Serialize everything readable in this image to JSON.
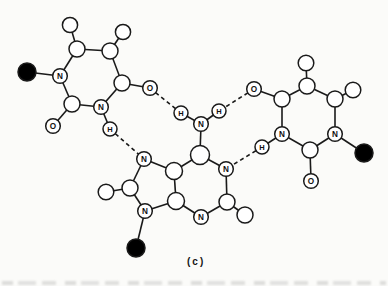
{
  "caption": "(c)",
  "palette": {
    "background": "#fbfbf9",
    "line": "#1a1a1a",
    "atom_fill": "#ffffff",
    "filled_atom": "#000000",
    "label_color": "#111111"
  },
  "molecule": {
    "description": "hydrogen-bonded base triplet: central purine flanked by two pyrimidines",
    "atoms": [
      {
        "id": "L_sugar",
        "x": 27,
        "y": 72,
        "r": 9,
        "type": "filled"
      },
      {
        "id": "L_N1",
        "x": 60,
        "y": 76,
        "r": 7.3,
        "type": "labeled",
        "label": "N"
      },
      {
        "id": "L_C6",
        "x": 77,
        "y": 49,
        "r": 8,
        "type": "open"
      },
      {
        "id": "L_H6",
        "x": 70,
        "y": 25,
        "r": 7.6,
        "type": "open"
      },
      {
        "id": "L_C5",
        "x": 110,
        "y": 51,
        "r": 8,
        "type": "open"
      },
      {
        "id": "L_H5",
        "x": 123,
        "y": 32,
        "r": 7.6,
        "type": "open"
      },
      {
        "id": "L_C4",
        "x": 122,
        "y": 83,
        "r": 8,
        "type": "open"
      },
      {
        "id": "L_O4",
        "x": 150,
        "y": 88,
        "r": 7.3,
        "type": "labeled",
        "label": "O"
      },
      {
        "id": "L_N3",
        "x": 101,
        "y": 107,
        "r": 7.3,
        "type": "labeled",
        "label": "N"
      },
      {
        "id": "L_H3",
        "x": 110,
        "y": 129,
        "r": 7,
        "type": "labeled",
        "label": "H"
      },
      {
        "id": "L_C2",
        "x": 72,
        "y": 104,
        "r": 8,
        "type": "open"
      },
      {
        "id": "L_O2",
        "x": 53,
        "y": 126,
        "r": 7.3,
        "type": "labeled",
        "label": "O"
      },
      {
        "id": "R_O4",
        "x": 254,
        "y": 89,
        "r": 7.3,
        "type": "labeled",
        "label": "O"
      },
      {
        "id": "R_C4",
        "x": 282,
        "y": 99,
        "r": 8,
        "type": "open"
      },
      {
        "id": "R_C5",
        "x": 307,
        "y": 86,
        "r": 8,
        "type": "open"
      },
      {
        "id": "R_H5",
        "x": 306,
        "y": 63,
        "r": 7.8,
        "type": "open"
      },
      {
        "id": "R_C6",
        "x": 335,
        "y": 99,
        "r": 8,
        "type": "open"
      },
      {
        "id": "R_H6",
        "x": 353,
        "y": 90,
        "r": 7.8,
        "type": "open"
      },
      {
        "id": "R_N1",
        "x": 335,
        "y": 134,
        "r": 7.3,
        "type": "labeled",
        "label": "N"
      },
      {
        "id": "R_sugar",
        "x": 364,
        "y": 153,
        "r": 9,
        "type": "filled"
      },
      {
        "id": "R_C2",
        "x": 310,
        "y": 150,
        "r": 8,
        "type": "open"
      },
      {
        "id": "R_O2",
        "x": 311,
        "y": 181,
        "r": 7.3,
        "type": "labeled",
        "label": "O"
      },
      {
        "id": "R_N3",
        "x": 282,
        "y": 134,
        "r": 7.3,
        "type": "labeled",
        "label": "N"
      },
      {
        "id": "R_H3",
        "x": 262,
        "y": 147,
        "r": 7,
        "type": "labeled",
        "label": "H"
      },
      {
        "id": "P_C6",
        "x": 200,
        "y": 155,
        "r": 9.5,
        "type": "open"
      },
      {
        "id": "P_N1",
        "x": 226,
        "y": 169,
        "r": 7.3,
        "type": "labeled",
        "label": "N"
      },
      {
        "id": "P_C2",
        "x": 227,
        "y": 202,
        "r": 8,
        "type": "open"
      },
      {
        "id": "P_H2",
        "x": 245,
        "y": 215,
        "r": 8,
        "type": "open"
      },
      {
        "id": "P_N3",
        "x": 201,
        "y": 217,
        "r": 7.3,
        "type": "labeled",
        "label": "N"
      },
      {
        "id": "P_C4",
        "x": 176,
        "y": 201,
        "r": 8.5,
        "type": "open"
      },
      {
        "id": "P_C5",
        "x": 174,
        "y": 171,
        "r": 8.5,
        "type": "open"
      },
      {
        "id": "P_N7",
        "x": 144,
        "y": 159,
        "r": 7.3,
        "type": "labeled",
        "label": "N"
      },
      {
        "id": "P_C8",
        "x": 130,
        "y": 188,
        "r": 8,
        "type": "open"
      },
      {
        "id": "P_H8",
        "x": 106,
        "y": 192,
        "r": 7.8,
        "type": "open"
      },
      {
        "id": "P_N9",
        "x": 145,
        "y": 211,
        "r": 7.3,
        "type": "labeled",
        "label": "N"
      },
      {
        "id": "P_sugar",
        "x": 136,
        "y": 248,
        "r": 9,
        "type": "filled"
      },
      {
        "id": "A_N",
        "x": 201,
        "y": 124,
        "r": 7.3,
        "type": "labeled",
        "label": "N"
      },
      {
        "id": "A_H1",
        "x": 181,
        "y": 113,
        "r": 7,
        "type": "labeled",
        "label": "H"
      },
      {
        "id": "A_H2",
        "x": 219,
        "y": 111,
        "r": 7,
        "type": "labeled",
        "label": "H"
      }
    ],
    "bonds": [
      [
        "L_sugar",
        "L_N1"
      ],
      [
        "L_N1",
        "L_C6"
      ],
      [
        "L_C6",
        "L_H6"
      ],
      [
        "L_C6",
        "L_C5"
      ],
      [
        "L_C5",
        "L_H5"
      ],
      [
        "L_C5",
        "L_C4"
      ],
      [
        "L_C4",
        "L_O4"
      ],
      [
        "L_C4",
        "L_N3"
      ],
      [
        "L_N3",
        "L_H3"
      ],
      [
        "L_N3",
        "L_C2"
      ],
      [
        "L_C2",
        "L_O2"
      ],
      [
        "L_C2",
        "L_N1"
      ],
      [
        "R_O4",
        "R_C4"
      ],
      [
        "R_C4",
        "R_C5"
      ],
      [
        "R_C5",
        "R_H5"
      ],
      [
        "R_C5",
        "R_C6"
      ],
      [
        "R_C6",
        "R_H6"
      ],
      [
        "R_C6",
        "R_N1"
      ],
      [
        "R_N1",
        "R_sugar"
      ],
      [
        "R_N1",
        "R_C2"
      ],
      [
        "R_C2",
        "R_O2"
      ],
      [
        "R_C2",
        "R_N3"
      ],
      [
        "R_N3",
        "R_H3"
      ],
      [
        "R_N3",
        "R_C4"
      ],
      [
        "P_C6",
        "P_N1"
      ],
      [
        "P_N1",
        "P_C2"
      ],
      [
        "P_C2",
        "P_H2"
      ],
      [
        "P_C2",
        "P_N3"
      ],
      [
        "P_N3",
        "P_C4"
      ],
      [
        "P_C4",
        "P_C5"
      ],
      [
        "P_C5",
        "P_C6"
      ],
      [
        "P_C5",
        "P_N7"
      ],
      [
        "P_N7",
        "P_C8"
      ],
      [
        "P_C8",
        "P_H8"
      ],
      [
        "P_C8",
        "P_N9"
      ],
      [
        "P_N9",
        "P_C4"
      ],
      [
        "P_N9",
        "P_sugar"
      ],
      [
        "P_C6",
        "A_N"
      ],
      [
        "A_N",
        "A_H1"
      ],
      [
        "A_N",
        "A_H2"
      ]
    ],
    "hydrogen_bonds": [
      [
        "L_O4",
        "A_H1"
      ],
      [
        "L_H3",
        "P_N7"
      ],
      [
        "R_O4",
        "A_H2"
      ],
      [
        "R_H3",
        "P_N1"
      ]
    ]
  }
}
